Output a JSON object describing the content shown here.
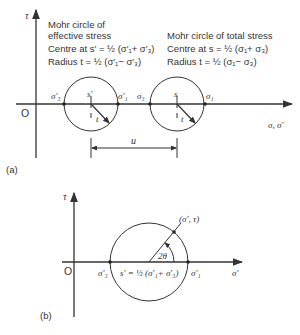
{
  "panel_a": {
    "caption": "(a)",
    "axis_y_label": "τ",
    "axis_x_label": "σ, σ′",
    "origin_label": "O",
    "effective": {
      "line1": "Mohr circle of",
      "line2": "effective stress",
      "centre": "Centre at s′ = ½ (σ′₁+ σ′₃)",
      "radius": "Radius t = ½ (σ′₁− σ′₃)",
      "sigma3": "σ′₃",
      "sigma1": "σ′₁",
      "centre_label": "s′",
      "radius_label": "t"
    },
    "total": {
      "line1": "Mohr circle of total stress",
      "centre": "Centre at s = ½ (σ₁+ σ₃)",
      "radius": "Radius t = ½ (σ₁− σ₃)",
      "sigma3": "σ₃",
      "sigma1": "σ₁",
      "centre_label": "s",
      "radius_label": "t"
    },
    "shift_label": "u"
  },
  "panel_b": {
    "caption": "(b)",
    "axis_y_label": "τ",
    "axis_x_label": "σ′",
    "origin_label": "O",
    "sigma3": "σ′₃",
    "sigma1": "σ′₁",
    "centre": "s′ = ½ (σ′₁+ σ′₃)",
    "point": "(σ′, τ)",
    "angle": "2θ"
  }
}
